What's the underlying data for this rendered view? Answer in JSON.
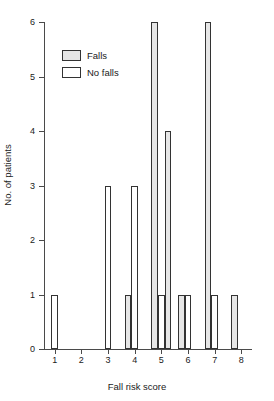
{
  "chart_data": {
    "type": "bar",
    "title": "",
    "xlabel": "Fall risk score",
    "ylabel": "No. of patients",
    "xlim": [
      0.6,
      8.4
    ],
    "ylim": [
      0,
      6
    ],
    "grid": false,
    "legend_position": "upper-left-inside",
    "xticks": [
      "1",
      "2",
      "3",
      "4",
      "5",
      "6",
      "7",
      "8"
    ],
    "xtick_values": [
      1,
      2,
      3,
      4,
      5,
      6,
      7,
      8
    ],
    "yticks": [
      "0",
      "1",
      "2",
      "3",
      "4",
      "5",
      "6"
    ],
    "ytick_values": [
      0,
      1,
      2,
      3,
      4,
      5,
      6
    ],
    "series": [
      {
        "name": "Falls",
        "color": "#e6e6e6",
        "points": [
          {
            "x": 3.75,
            "y": 1
          },
          {
            "x": 4.75,
            "y": 6
          },
          {
            "x": 5.25,
            "y": 4
          },
          {
            "x": 5.75,
            "y": 1
          },
          {
            "x": 6.75,
            "y": 6
          },
          {
            "x": 7.75,
            "y": 1
          }
        ]
      },
      {
        "name": "No falls",
        "color": "#ffffff",
        "points": [
          {
            "x": 1.0,
            "y": 1
          },
          {
            "x": 3.0,
            "y": 3
          },
          {
            "x": 4.0,
            "y": 3
          },
          {
            "x": 5.0,
            "y": 1
          },
          {
            "x": 6.0,
            "y": 1
          },
          {
            "x": 7.0,
            "y": 1
          }
        ]
      }
    ],
    "bar_width": 0.25
  },
  "legend": {
    "items": [
      {
        "label": "Falls",
        "swatch": "falls"
      },
      {
        "label": "No falls",
        "swatch": "nofalls"
      }
    ]
  },
  "axes": {
    "x_label": "Fall risk score",
    "y_label": "No. of patients"
  }
}
